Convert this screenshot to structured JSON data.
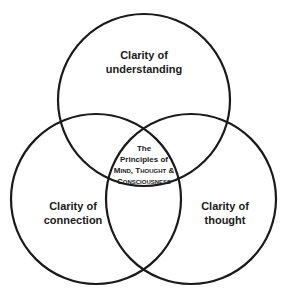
{
  "diagram": {
    "type": "venn",
    "circles": [
      {
        "id": "top",
        "label": "Clarity of understanding",
        "line1": "Clarity of",
        "line2": "understanding",
        "cx": 144,
        "cy": 100,
        "r": 86
      },
      {
        "id": "left",
        "label": "Clarity of connection",
        "line1": "Clarity of",
        "line2": "connection",
        "cx": 96,
        "cy": 199,
        "r": 85
      },
      {
        "id": "right",
        "label": "Clarity of thought",
        "line1": "Clarity of",
        "line2": "thought",
        "cx": 191,
        "cy": 199,
        "r": 85
      }
    ],
    "center": {
      "line1": "The",
      "line2": "Principles of",
      "line3": "Mind, Thought &",
      "line4": "Consciousness"
    },
    "stroke_color": "#1a1a1a",
    "background": "#ffffff"
  }
}
